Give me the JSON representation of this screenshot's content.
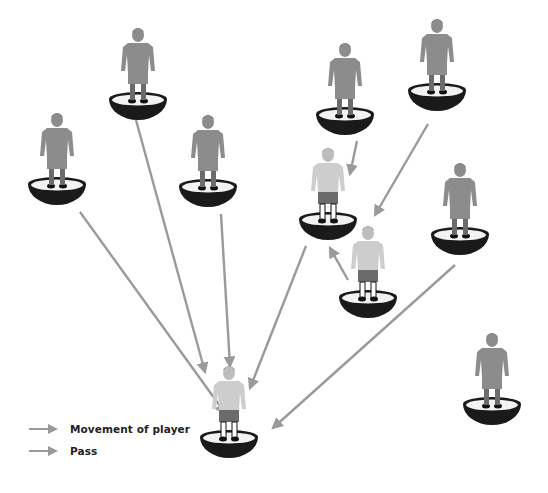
{
  "diagram": {
    "type": "subbuteo-passing-network",
    "colors": {
      "arrow": "#9a9a9a",
      "player_kit_dark": "#8c8c8c",
      "player_kit_light": "#c8c8c8",
      "shorts_light_team": "#6b6b6b",
      "base": "#1a1a1a",
      "base_top": "#f2f2f2",
      "hair": "#222222"
    },
    "players": [
      {
        "id": "p1",
        "x": 57,
        "y": 180,
        "kit": "dark"
      },
      {
        "id": "p2",
        "x": 138,
        "y": 95,
        "kit": "dark"
      },
      {
        "id": "p3",
        "x": 208,
        "y": 182,
        "kit": "dark"
      },
      {
        "id": "p4",
        "x": 345,
        "y": 110,
        "kit": "dark"
      },
      {
        "id": "p5",
        "x": 437,
        "y": 86,
        "kit": "dark"
      },
      {
        "id": "p6",
        "x": 328,
        "y": 215,
        "kit": "light"
      },
      {
        "id": "p7",
        "x": 460,
        "y": 230,
        "kit": "dark"
      },
      {
        "id": "p8",
        "x": 368,
        "y": 293,
        "kit": "light"
      },
      {
        "id": "p9",
        "x": 229,
        "y": 433,
        "kit": "light"
      },
      {
        "id": "p10",
        "x": 492,
        "y": 400,
        "kit": "dark"
      }
    ],
    "arrows": [
      {
        "from": "p1",
        "x1": 80,
        "y1": 212,
        "x2": 225,
        "y2": 413,
        "kind": "pass"
      },
      {
        "from": "p2",
        "x1": 136,
        "y1": 120,
        "x2": 205,
        "y2": 372,
        "kind": "pass"
      },
      {
        "from": "p3",
        "x1": 221,
        "y1": 214,
        "x2": 230,
        "y2": 366,
        "kind": "pass"
      },
      {
        "from": "p6",
        "x1": 306,
        "y1": 246,
        "x2": 250,
        "y2": 388,
        "kind": "pass"
      },
      {
        "from": "p7",
        "x1": 455,
        "y1": 265,
        "x2": 273,
        "y2": 428,
        "kind": "pass"
      },
      {
        "from": "p4",
        "x1": 357,
        "y1": 141,
        "x2": 350,
        "y2": 174,
        "kind": "movement"
      },
      {
        "from": "p5",
        "x1": 428,
        "y1": 124,
        "x2": 375,
        "y2": 215,
        "kind": "movement"
      },
      {
        "from": "p8",
        "x1": 348,
        "y1": 280,
        "x2": 330,
        "y2": 248,
        "kind": "movement"
      }
    ]
  },
  "legend": {
    "items": [
      {
        "label": "Movement of player",
        "kind": "movement"
      },
      {
        "label": "Pass",
        "kind": "pass"
      }
    ]
  }
}
